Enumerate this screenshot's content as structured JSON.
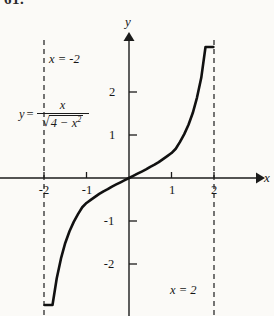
{
  "figure": {
    "problem_number": "61.",
    "background_color": "#fbfaf7",
    "ink_color": "#1b1b1b"
  },
  "axes": {
    "x_axis_label": "x",
    "y_axis_label": "y",
    "x_ticks": [
      "-2",
      "-1",
      "1",
      "2"
    ],
    "y_ticks": [
      "2",
      "1",
      "-1",
      "-2"
    ]
  },
  "annotations": {
    "asymptote_left": "x = -2",
    "asymptote_right": "x = 2",
    "equation": {
      "lhs": "y",
      "equals": "=",
      "numerator": "x",
      "radical_sign": "√",
      "radicand_base": "4 − x",
      "radicand_exponent": "2"
    }
  },
  "chart_data": {
    "type": "line",
    "title": "",
    "xlabel": "x",
    "ylabel": "y",
    "equation_text": "y = x / sqrt(4 - x^2)",
    "xlim": [
      -2.3,
      2.3
    ],
    "ylim": [
      -3.0,
      3.05
    ],
    "grid": false,
    "legend": null,
    "xticks": [
      -2,
      -1,
      1,
      2
    ],
    "yticks": [
      2,
      1,
      -1,
      -2
    ],
    "asymptotes": [
      {
        "type": "vertical",
        "x": -2,
        "label": "x = -2",
        "style": "dashed"
      },
      {
        "type": "vertical",
        "x": 2,
        "label": "x = 2",
        "style": "dashed"
      }
    ],
    "series": [
      {
        "name": "y = x / sqrt(4 - x^2)",
        "style": "solid",
        "x": [
          -1.985,
          -1.97,
          -1.95,
          -1.92,
          -1.88,
          -1.84,
          -1.8,
          -1.7,
          -1.6,
          -1.5,
          -1.4,
          -1.3,
          -1.2,
          -1.1,
          -1.0,
          -0.9,
          -0.8,
          -0.7,
          -0.6,
          -0.5,
          -0.4,
          -0.3,
          -0.2,
          -0.1,
          0.0,
          0.1,
          0.2,
          0.3,
          0.4,
          0.5,
          0.6,
          0.7,
          0.8,
          0.9,
          1.0,
          1.1,
          1.2,
          1.3,
          1.4,
          1.5,
          1.6,
          1.7,
          1.8,
          1.84,
          1.88,
          1.92,
          1.95,
          1.97,
          1.985
        ],
        "y": [
          -11.19,
          -7.94,
          -6.24,
          -4.94,
          -4.03,
          -3.45,
          -3.09,
          -2.33,
          -1.87,
          -1.51,
          -1.24,
          -1.02,
          -0.84,
          -0.68,
          -0.58,
          -0.51,
          -0.44,
          -0.37,
          -0.31,
          -0.26,
          -0.2,
          -0.15,
          -0.1,
          -0.05,
          0.0,
          0.05,
          0.1,
          0.15,
          0.2,
          0.26,
          0.31,
          0.37,
          0.44,
          0.51,
          0.58,
          0.68,
          0.84,
          1.02,
          1.24,
          1.51,
          1.87,
          2.33,
          3.09,
          3.45,
          4.03,
          4.94,
          6.24,
          7.94,
          11.19
        ]
      }
    ]
  }
}
